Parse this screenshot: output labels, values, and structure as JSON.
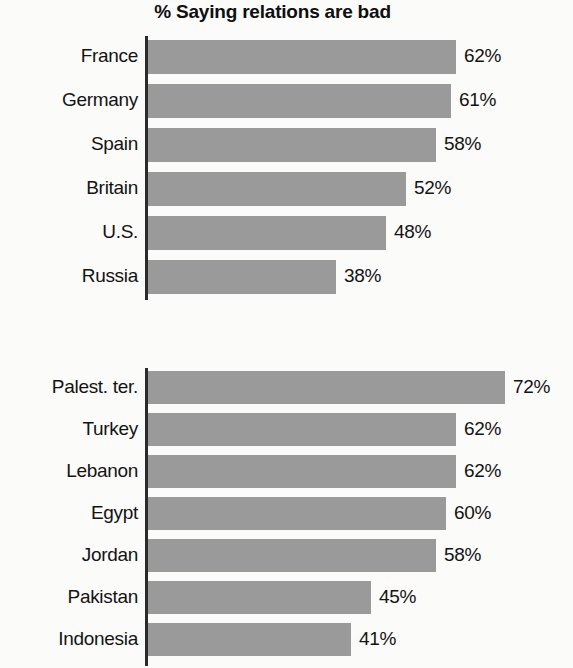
{
  "chart_data": {
    "type": "bar",
    "title": "% Saying relations are bad",
    "subtitle": "",
    "xlabel": "",
    "ylabel": "",
    "orientation": "horizontal",
    "grid": false,
    "legend": "none",
    "xlim": [
      0,
      100
    ],
    "value_suffix": "%",
    "panels": [
      {
        "name": "western-publics",
        "categories": [
          "France",
          "Germany",
          "Spain",
          "Britain",
          "U.S.",
          "Russia"
        ],
        "values": [
          62,
          61,
          58,
          52,
          48,
          38
        ],
        "value_labels": [
          "62%",
          "61%",
          "58%",
          "52%",
          "48%",
          "38%"
        ]
      },
      {
        "name": "muslim-publics",
        "categories": [
          "Palest. ter.",
          "Turkey",
          "Lebanon",
          "Egypt",
          "Jordan",
          "Pakistan",
          "Indonesia"
        ],
        "values": [
          72,
          62,
          62,
          60,
          58,
          45,
          41
        ],
        "value_labels": [
          "72%",
          "62%",
          "62%",
          "60%",
          "58%",
          "45%",
          "41%"
        ]
      }
    ],
    "colors": {
      "bar": "#9a9a9a",
      "axis": "#2c2b2b",
      "text": "#141313",
      "background": "#fbfbfa"
    },
    "scale_px_per_percent": 4.96
  }
}
